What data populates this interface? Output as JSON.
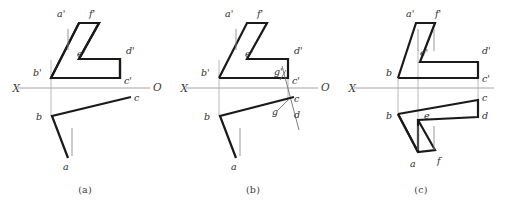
{
  "sheet": {
    "title": "Orthographic projection exercise - three variants",
    "background_color": "#ffffff",
    "width": 506,
    "height": 212
  },
  "style": {
    "heavy_line_color": "#1a1a1a",
    "thin_line_color": "#8c8c8c",
    "axis_line_color": "#9a9a9a",
    "label_color": "#2b2b2b",
    "heavy_line_width": 2.2,
    "thin_line_width": 0.8
  },
  "panels": [
    {
      "id": "a",
      "caption": "(a)",
      "axis": {
        "left_label": "X",
        "right_label": "O",
        "y": 88,
        "x_start": 18,
        "x_end": 150
      },
      "labels": [
        {
          "name": "a-prime",
          "text": "a'",
          "x": 57,
          "y": 17
        },
        {
          "name": "f-prime",
          "text": "f'",
          "x": 89,
          "y": 17
        },
        {
          "name": "e-prime",
          "text": "e'",
          "x": 77,
          "y": 55
        },
        {
          "name": "d-prime",
          "text": "d'",
          "x": 128,
          "y": 54
        },
        {
          "name": "b-prime",
          "text": "b'",
          "x": 36,
          "y": 73
        },
        {
          "name": "c-prime",
          "text": "c'",
          "x": 128,
          "y": 82
        },
        {
          "name": "b",
          "text": "b",
          "x": 38,
          "y": 118
        },
        {
          "name": "c",
          "text": "c",
          "x": 131,
          "y": 100
        },
        {
          "name": "a",
          "text": "a",
          "x": 64,
          "y": 168
        }
      ],
      "front_view_outline": "51,23 79,23 79,59 120,59 120,78 51,78",
      "front_diagonal": "51,78 79,23",
      "front_inner_edge": "79,23 70,59",
      "arrow_stem": {
        "x": 68,
        "y1": 28,
        "y2": 48
      },
      "top_view_path": "52,115 131,96",
      "top_view_b_to_a": "52,115 68,158",
      "top_arrow_stem": {
        "x": 72,
        "y1": 128,
        "y2": 155
      },
      "projector_lines": [
        {
          "x1": 51,
          "y1": 78,
          "x2": 51,
          "y2": 115
        }
      ]
    },
    {
      "id": "b",
      "caption": "(b)",
      "axis": {
        "left_label": "X",
        "right_label": "O",
        "y": 88,
        "x_start": 18,
        "x_end": 150
      },
      "labels": [
        {
          "name": "a-prime",
          "text": "a'",
          "x": 57,
          "y": 17
        },
        {
          "name": "f-prime",
          "text": "f'",
          "x": 89,
          "y": 17
        },
        {
          "name": "e-prime",
          "text": "e'",
          "x": 77,
          "y": 55
        },
        {
          "name": "d-prime",
          "text": "d'",
          "x": 128,
          "y": 54
        },
        {
          "name": "b-prime",
          "text": "b'",
          "x": 36,
          "y": 73
        },
        {
          "name": "g-prime",
          "text": "g'",
          "x": 114,
          "y": 73
        },
        {
          "name": "c-prime",
          "text": "c'",
          "x": 131,
          "y": 80
        },
        {
          "name": "b",
          "text": "b",
          "x": 38,
          "y": 118
        },
        {
          "name": "c",
          "text": "c",
          "x": 132,
          "y": 101
        },
        {
          "name": "g",
          "text": "g",
          "x": 114,
          "y": 113
        },
        {
          "name": "d",
          "text": "d",
          "x": 133,
          "y": 116
        },
        {
          "name": "a",
          "text": "a",
          "x": 64,
          "y": 168
        }
      ],
      "front_view_outline": "51,23 79,23 79,59 120,59 120,78 51,78",
      "front_diagonal": "51,78 79,23",
      "front_inner_edge": "79,23 70,59",
      "arrow_stem": {
        "x": 68,
        "y1": 28,
        "y2": 48
      },
      "top_view_path": "52,115 127,96",
      "top_view_b_to_a": "52,115 68,158",
      "top_arrow_stem": {
        "x": 72,
        "y1": 128,
        "y2": 155
      },
      "aux_thin_diagonal": "117,70 130,128",
      "aux_vertical": {
        "x": 120,
        "y1": 78,
        "y2": 100
      },
      "aux_marker_g_prime": "113,78 118,70",
      "aux_marker_g": "110,108 120,100",
      "projector_lines": [
        {
          "x1": 51,
          "y1": 78,
          "x2": 51,
          "y2": 115
        }
      ]
    },
    {
      "id": "c",
      "caption": "(c)",
      "axis": {
        "left_label": "X",
        "right_label": "O",
        "y": 88,
        "x_start": 18,
        "x_end": 156
      },
      "labels": [
        {
          "name": "a-prime",
          "text": "a'",
          "x": 70,
          "y": 17
        },
        {
          "name": "f-prime",
          "text": "f'",
          "x": 99,
          "y": 17
        },
        {
          "name": "e-prime",
          "text": "e'",
          "x": 86,
          "y": 54
        },
        {
          "name": "d-prime",
          "text": "d'",
          "x": 139,
          "y": 53
        },
        {
          "name": "b-prime",
          "text": "b",
          "x": 47,
          "y": 73
        },
        {
          "name": "c-prime",
          "text": "c'",
          "x": 140,
          "y": 81
        },
        {
          "name": "b",
          "text": "b",
          "x": 47,
          "y": 117
        },
        {
          "name": "e",
          "text": "e",
          "x": 86,
          "y": 117
        },
        {
          "name": "c",
          "text": "c",
          "x": 141,
          "y": 100
        },
        {
          "name": "d",
          "text": "d",
          "x": 141,
          "y": 117
        },
        {
          "name": "a",
          "text": "a",
          "x": 76,
          "y": 165
        },
        {
          "name": "f",
          "text": "f",
          "x": 101,
          "y": 163
        }
      ],
      "front_view_outline": "62,78 62,78 80,23 99,23 99,62 142,62 142,78",
      "front_diagonal": "62,78 80,23",
      "front_inner_edge": "99,23 84,62",
      "arrow_stem": {
        "x": 82,
        "y1": 28,
        "y2": 50
      },
      "top_view_outline": "62,114 142,100 142,117 82,120 82,152 62,114",
      "top_arrow_stem_1": {
        "x": 82,
        "y1": 126,
        "y2": 150
      },
      "top_arrow_stem_2": {
        "x": 98,
        "y1": 126,
        "y2": 150
      },
      "projector_lines": [
        {
          "x1": 62,
          "y1": 78,
          "x2": 62,
          "y2": 114
        },
        {
          "x1": 82,
          "y1": 62,
          "x2": 82,
          "y2": 120
        },
        {
          "x1": 142,
          "y1": 78,
          "x2": 142,
          "y2": 100
        }
      ]
    }
  ]
}
